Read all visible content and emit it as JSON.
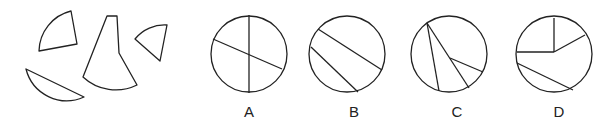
{
  "puzzle": {
    "pieces": [
      {
        "id": "quarter-sector",
        "description": "quarter-circle sector piece"
      },
      {
        "id": "circular-segment",
        "description": "circular segment piece"
      },
      {
        "id": "truncated-sector",
        "description": "large tapered sector piece"
      },
      {
        "id": "small-sector",
        "description": "small sector piece"
      }
    ],
    "options": [
      {
        "label": "A",
        "description": "circle divided by a vertical diameter and a slanted diameter"
      },
      {
        "label": "B",
        "description": "circle cut by two parallel slanted chords"
      },
      {
        "label": "C",
        "description": "circle cut by a chord and lines meeting at an interior point"
      },
      {
        "label": "D",
        "description": "circle with a quarter sector, adjacent sector and a chord"
      }
    ]
  },
  "colors": {
    "stroke": "#222222",
    "background": "#ffffff"
  }
}
